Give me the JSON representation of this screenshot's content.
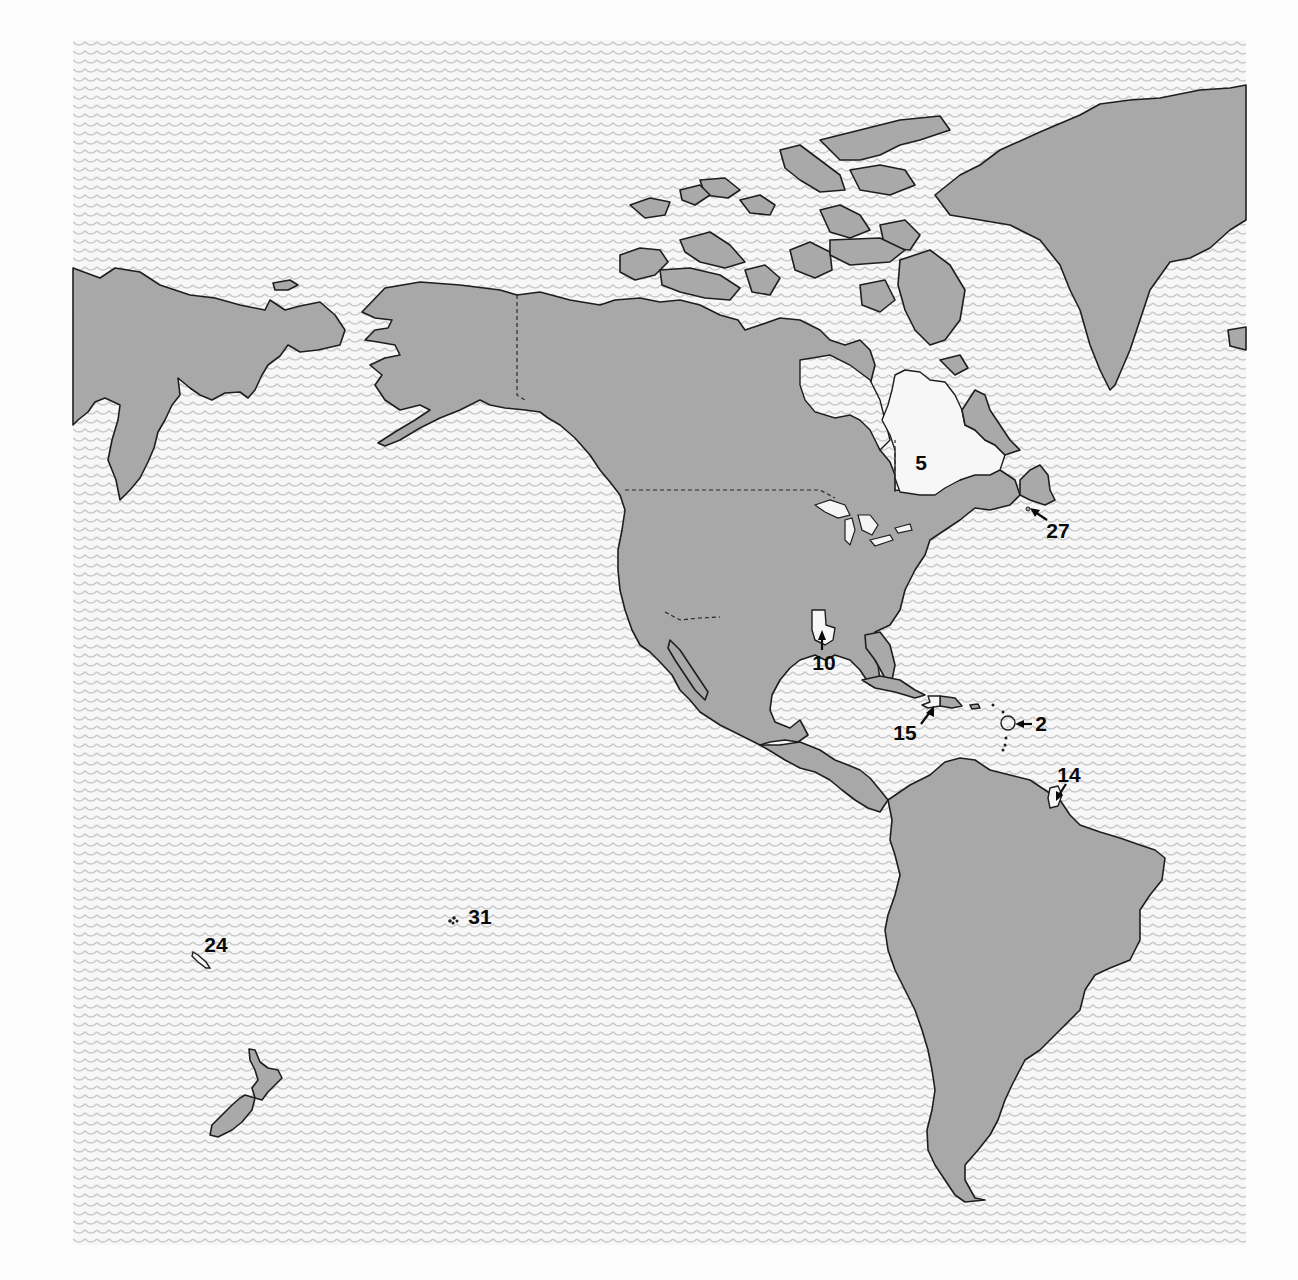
{
  "map": {
    "title": "",
    "region": "Americas and Pacific",
    "colors": {
      "ocean_pattern": "#c9c9c9",
      "ocean_bg": "#f7f7f7",
      "land": "#a9a9a9",
      "highlighted_land": "#f7f7f7",
      "outline": "#1e1e1e",
      "label": "#0a0a0a"
    },
    "pattern_bounds": {
      "left": 73,
      "top": 40,
      "right": 1246,
      "bottom": 1245
    },
    "landmasses": [
      "Siberia",
      "Alaska",
      "Canada",
      "Canadian Arctic Archipelago",
      "Greenland",
      "United States",
      "Mexico",
      "Central America",
      "Caribbean",
      "South America",
      "New Zealand"
    ],
    "labels": [
      {
        "id": "5",
        "text": "5",
        "x": 921,
        "y": 462,
        "target": "Quebec"
      },
      {
        "id": "27",
        "text": "27",
        "x": 1050,
        "y": 532,
        "target": "Saint Pierre and Miquelon"
      },
      {
        "id": "10",
        "text": "10",
        "x": 824,
        "y": 668,
        "target": "Louisiana"
      },
      {
        "id": "15",
        "text": "15",
        "x": 905,
        "y": 736,
        "target": "Haiti"
      },
      {
        "id": "2",
        "text": "2",
        "x": 1040,
        "y": 731,
        "target": "Guadeloupe"
      },
      {
        "id": "14",
        "text": "14",
        "x": 1068,
        "y": 796,
        "target": "French Guiana"
      },
      {
        "id": "24",
        "text": "24",
        "x": 214,
        "y": 947,
        "target": "New Caledonia"
      },
      {
        "id": "31",
        "text": "31",
        "x": 478,
        "y": 918,
        "target": "Wallis and Futuna"
      }
    ]
  }
}
